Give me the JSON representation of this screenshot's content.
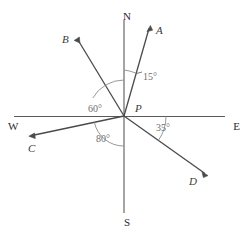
{
  "figure": {
    "center_label": "P",
    "cardinals": [
      {
        "name": "north",
        "label": "N",
        "x": 131,
        "y": 16
      },
      {
        "name": "south",
        "label": "S",
        "x": 131,
        "y": 224
      },
      {
        "name": "west",
        "label": "W",
        "x": 10,
        "y": 129
      },
      {
        "name": "east",
        "label": "E",
        "x": 229,
        "y": 129
      }
    ],
    "center": {
      "label": "P",
      "x": 124,
      "y": 116,
      "label_x": 135,
      "label_y": 112
    },
    "rays": [
      {
        "name": "ray-a",
        "label": "A",
        "bearing_deg": 15,
        "bearing_text": "N15°E",
        "tip_x": 150,
        "tip_y": 27,
        "label_x": 156,
        "label_y": 33
      },
      {
        "name": "ray-b",
        "label": "B",
        "bearing_deg": 300,
        "bearing_text": "N60°W",
        "tip_x": 77,
        "tip_y": 39,
        "label_x": 62,
        "label_y": 43
      },
      {
        "name": "ray-c",
        "label": "C",
        "bearing_deg": 260,
        "bearing_text": "S80°W",
        "tip_x": 30,
        "tip_y": 136,
        "label_x": 29,
        "label_y": 151
      },
      {
        "name": "ray-d",
        "label": "D",
        "bearing_deg": 125,
        "bearing_text": "S55°E",
        "tip_x": 207,
        "tip_y": 175,
        "label_x": 191,
        "label_y": 184
      }
    ],
    "angles": [
      {
        "name": "angle-15",
        "label": "15°",
        "value": 15,
        "unit": "degrees",
        "x": 140,
        "y": 80,
        "from": "north-axis",
        "to": "ray-a"
      },
      {
        "name": "angle-60",
        "label": "60°",
        "value": 60,
        "unit": "degrees",
        "x": 90,
        "y": 112,
        "from": "north-axis",
        "to": "ray-b"
      },
      {
        "name": "angle-80",
        "label": "80°",
        "value": 80,
        "unit": "degrees",
        "x": 97,
        "y": 141,
        "from": "south-axis",
        "to": "ray-c"
      },
      {
        "name": "angle-35",
        "label": "35°",
        "value": 35,
        "unit": "degrees",
        "x": 155,
        "y": 130,
        "from": "east-axis",
        "to": "ray-d"
      }
    ],
    "colors": {
      "axis": "#5a5a5a",
      "ray": "#4a4a4a",
      "arc": "#8c8c8c",
      "label": "#3b3b3b",
      "angle_label": "#6e6e6e",
      "background": "#ffffff"
    }
  }
}
